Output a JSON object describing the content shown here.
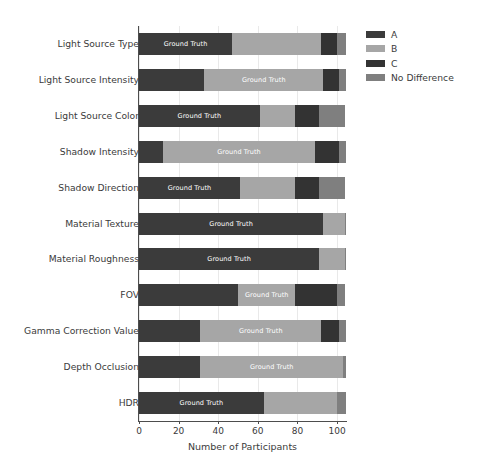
{
  "chart_data": {
    "type": "bar",
    "orientation": "horizontal",
    "stacked": true,
    "title": "",
    "xlabel": "Number of Participants",
    "ylabel": "",
    "xlim": [
      0,
      104.5
    ],
    "ylim": [
      0,
      11
    ],
    "xticks": [
      0,
      20,
      40,
      60,
      80,
      100
    ],
    "xticklabels": [
      "0",
      "20",
      "40",
      "60",
      "80",
      "100"
    ],
    "grid": "vertical",
    "legend_position": "upper right outside",
    "bar_value_label": "Ground Truth",
    "categories": [
      "Light Source Type",
      "Light Source Intensity",
      "Light Source Color",
      "Shadow Intensity",
      "Shadow Direction",
      "Material Texture",
      "Material Roughness",
      "FOV",
      "Gamma Correction Value",
      "Depth Occlusion",
      "HDR"
    ],
    "series": [
      {
        "name": "A",
        "color": "#3b3b3b",
        "values": [
          47,
          33,
          61,
          12,
          51,
          93,
          91,
          50,
          31,
          31,
          63
        ]
      },
      {
        "name": "B",
        "color": "#a6a6a6",
        "values": [
          45,
          60,
          18,
          77,
          28,
          11,
          13,
          29,
          61,
          72,
          37
        ]
      },
      {
        "name": "C",
        "color": "#333333",
        "values": [
          8,
          8,
          12,
          12,
          12,
          0,
          0,
          21,
          9,
          0,
          0
        ]
      },
      {
        "name": "No Difference",
        "color": "#7f7f7f",
        "values": [
          4.5,
          3.5,
          13,
          3.5,
          13,
          0.5,
          0.5,
          4,
          3.5,
          1.5,
          4.5
        ]
      }
    ],
    "ground_truth_series_index": [
      0,
      1,
      0,
      1,
      0,
      0,
      0,
      1,
      1,
      1,
      0
    ]
  },
  "legend": {
    "items": [
      {
        "label": "A",
        "color": "#3b3b3b"
      },
      {
        "label": "B",
        "color": "#a6a6a6"
      },
      {
        "label": "C",
        "color": "#333333"
      },
      {
        "label": "No Difference",
        "color": "#7f7f7f"
      }
    ]
  }
}
